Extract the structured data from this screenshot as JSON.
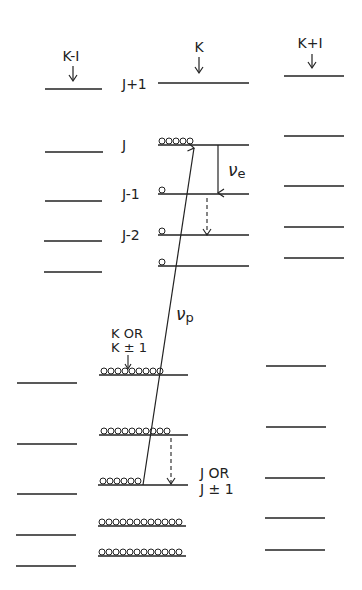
{
  "diagram": {
    "columns": {
      "left": {
        "label": "K-I"
      },
      "center": {
        "label": "K"
      },
      "right": {
        "label": "K+I"
      }
    },
    "levels": {
      "j_plus_1": "J+1",
      "j": "J",
      "j_minus_1": "J-1",
      "j_minus_2": "J-2"
    },
    "transitions": {
      "emission": {
        "symbol": "ν",
        "subscript": "e"
      },
      "pump": {
        "symbol": "ν",
        "subscript": "p"
      }
    },
    "annotations": {
      "k_or_line1": "K OR",
      "k_or_line2": "K ± 1",
      "j_or_line1": "J OR",
      "j_or_line2": "J ± 1"
    },
    "colors": {
      "ink": "#222222",
      "background": "#ffffff"
    }
  }
}
